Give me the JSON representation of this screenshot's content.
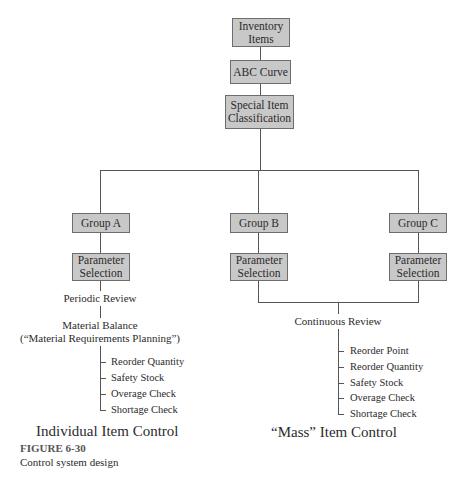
{
  "diagram": {
    "top": [
      {
        "label": "Inventory Items"
      },
      {
        "label": "ABC Curve"
      },
      {
        "label": "Special Item Classification"
      }
    ],
    "groups": [
      {
        "label": "Group A",
        "param": "Parameter Selection"
      },
      {
        "label": "Group B",
        "param": "Parameter Selection"
      },
      {
        "label": "Group C",
        "param": "Parameter Selection"
      }
    ],
    "individual": {
      "review": "Periodic Review",
      "balance_line1": "Material Balance",
      "balance_line2": "(“Material Requirements Planning”)",
      "items": [
        "Reorder Quantity",
        "Safety Stock",
        "Overage Check",
        "Shortage Check"
      ],
      "title": "Individual Item Control"
    },
    "mass": {
      "review": "Continuous Review",
      "items": [
        "Reorder Point",
        "Reorder Quantity",
        "Safety Stock",
        "Overage Check",
        "Shortage Check"
      ],
      "title": "“Mass” Item Control"
    }
  },
  "figure": {
    "label": "FIGURE 6-30",
    "caption": "Control system design"
  },
  "colors": {
    "box_fill": "#c8c8c8",
    "box_border": "#6d6d6d",
    "line": "#555555",
    "text": "#2b2b2b"
  }
}
